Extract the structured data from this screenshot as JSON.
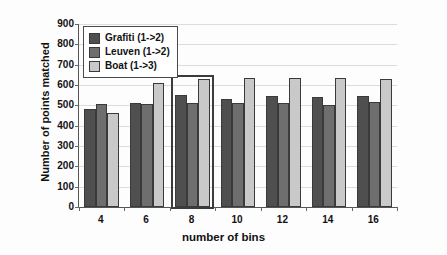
{
  "chart_data": {
    "type": "bar",
    "title": "",
    "xlabel": "number of bins",
    "ylabel": "Number of points matched",
    "categories": [
      "4",
      "6",
      "8",
      "10",
      "12",
      "14",
      "16"
    ],
    "ylim": [
      0,
      900
    ],
    "yticks": [
      0,
      100,
      200,
      300,
      400,
      500,
      600,
      700,
      800,
      900
    ],
    "ytick_labels": [
      "0",
      "100",
      "200",
      "300",
      "400",
      "500",
      "600",
      "700",
      "800",
      "900"
    ],
    "grid": true,
    "legend_position": "upper-left",
    "series": [
      {
        "name": "Grafiti (1->2)",
        "color": "#4f4f4f",
        "values": [
          480,
          512,
          553,
          533,
          546,
          540,
          544
        ]
      },
      {
        "name": "Leuven (1->2)",
        "color": "#6e6e6e",
        "values": [
          505,
          509,
          513,
          510,
          510,
          503,
          515
        ]
      },
      {
        "name": "Boat (1->3)",
        "color": "#c9c9c9",
        "values": [
          461,
          610,
          631,
          635,
          636,
          633,
          631
        ]
      }
    ],
    "annotations": [
      {
        "type": "highlight-rectangle",
        "category": "8",
        "note": "rectangle outline drawn around the bin=8 group"
      }
    ]
  },
  "legend": {
    "entries": [
      {
        "label": "Grafiti (1->2)",
        "color": "#4f4f4f"
      },
      {
        "label": "Leuven (1->2)",
        "color": "#6e6e6e"
      },
      {
        "label": "Boat (1->3)",
        "color": "#c9c9c9"
      }
    ]
  }
}
